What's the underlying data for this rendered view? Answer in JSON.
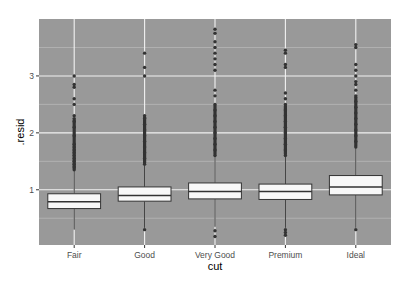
{
  "chart_data": {
    "type": "boxplot",
    "title": "",
    "xlabel": "cut",
    "ylabel": ".resid",
    "categories": [
      "Fair",
      "Good",
      "Very Good",
      "Premium",
      "Ideal"
    ],
    "ylim": [
      0.03,
      4.0
    ],
    "yticks": [
      1,
      2,
      3
    ],
    "grid": true,
    "legend": "none",
    "theme": {
      "panel_bg": "#999999",
      "grid_major": "#f2f2f2",
      "grid_minor": "#b8b8b8",
      "box_fill": "#f8f8f8",
      "box_line": "#333333",
      "point_color": "#333333"
    },
    "series": [
      {
        "name": "Fair",
        "q1": 0.67,
        "median": 0.79,
        "q3": 0.93,
        "whisker_low": 0.3,
        "whisker_high": 1.35,
        "outliers_high": [
          1.35,
          1.4,
          1.45,
          1.5,
          1.55,
          1.6,
          1.65,
          1.7,
          1.75,
          1.8,
          1.95,
          2.1,
          2.2,
          2.25,
          2.3,
          2.5,
          2.6,
          2.8,
          2.85,
          3.0
        ],
        "outliers_low": []
      },
      {
        "name": "Good",
        "q1": 0.8,
        "median": 0.9,
        "q3": 1.05,
        "whisker_low": 0.33,
        "whisker_high": 1.45,
        "outliers_high": [
          1.45,
          1.55,
          1.65,
          1.75,
          1.85,
          1.95,
          2.05,
          2.15,
          2.25,
          2.3,
          3.0,
          3.15,
          3.4
        ],
        "outliers_low": [
          0.3
        ]
      },
      {
        "name": "Very Good",
        "q1": 0.84,
        "median": 0.97,
        "q3": 1.12,
        "whisker_low": 0.35,
        "whisker_high": 1.6,
        "outliers_high": [
          1.6,
          1.7,
          1.8,
          1.9,
          2.0,
          2.1,
          2.2,
          2.3,
          2.4,
          2.5,
          2.65,
          2.75,
          3.1,
          3.2,
          3.3,
          3.4,
          3.5,
          3.6,
          3.75,
          3.82
        ],
        "outliers_low": [
          0.28,
          0.18
        ]
      },
      {
        "name": "Premium",
        "q1": 0.83,
        "median": 0.97,
        "q3": 1.1,
        "whisker_low": 0.33,
        "whisker_high": 1.6,
        "outliers_high": [
          1.6,
          1.7,
          1.8,
          1.9,
          2.0,
          2.1,
          2.2,
          2.3,
          2.4,
          2.5,
          2.6,
          2.7,
          3.15,
          3.2,
          3.4,
          3.45
        ],
        "outliers_low": [
          0.3,
          0.25,
          0.2
        ]
      },
      {
        "name": "Ideal",
        "q1": 0.91,
        "median": 1.05,
        "q3": 1.25,
        "whisker_low": 0.33,
        "whisker_high": 1.75,
        "outliers_high": [
          1.75,
          1.85,
          1.95,
          2.05,
          2.15,
          2.25,
          2.35,
          2.45,
          2.55,
          2.65,
          2.75,
          2.85,
          2.9,
          3.0,
          3.1,
          3.2,
          3.5,
          3.55
        ],
        "outliers_low": [
          0.3
        ]
      }
    ]
  }
}
